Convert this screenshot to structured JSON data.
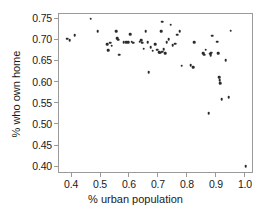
{
  "chart_data": {
    "type": "scatter",
    "title": "",
    "xlabel": "% urban population",
    "ylabel": "% who own home",
    "xlim": [
      0.355,
      1.028
    ],
    "ylim": [
      0.384,
      0.762
    ],
    "xticks": [
      0.4,
      0.5,
      0.6,
      0.7,
      0.8,
      0.9,
      1.0
    ],
    "xtick_labels": [
      "0.4",
      "0.5",
      "0.6",
      "0.7",
      "0.8",
      "0.9",
      "1.0"
    ],
    "yticks": [
      0.4,
      0.45,
      0.5,
      0.55,
      0.6,
      0.65,
      0.7,
      0.75
    ],
    "ytick_labels": [
      "0.40",
      "0.45",
      "0.50",
      "0.55",
      "0.60",
      "0.65",
      "0.70",
      "0.75"
    ],
    "grid": false,
    "legend": "none",
    "marker": "filled-circle",
    "marker_color": "#2b2b2b",
    "frame_color": "#9a9a9a",
    "background": "#ffffff",
    "n_points": 66,
    "points": [
      [
        0.383,
        0.704
      ],
      [
        0.392,
        0.7
      ],
      [
        0.409,
        0.712
      ],
      [
        0.464,
        0.751
      ],
      [
        0.489,
        0.721
      ],
      [
        0.521,
        0.69
      ],
      [
        0.524,
        0.676
      ],
      [
        0.531,
        0.694
      ],
      [
        0.537,
        0.687
      ],
      [
        0.553,
        0.722
      ],
      [
        0.556,
        0.705
      ],
      [
        0.559,
        0.701
      ],
      [
        0.563,
        0.666
      ],
      [
        0.578,
        0.695
      ],
      [
        0.586,
        0.696
      ],
      [
        0.594,
        0.695
      ],
      [
        0.6,
        0.714
      ],
      [
        0.606,
        0.697
      ],
      [
        0.612,
        0.694
      ],
      [
        0.633,
        0.697
      ],
      [
        0.638,
        0.7
      ],
      [
        0.642,
        0.694
      ],
      [
        0.648,
        0.68
      ],
      [
        0.654,
        0.721
      ],
      [
        0.661,
        0.695
      ],
      [
        0.665,
        0.624
      ],
      [
        0.672,
        0.683
      ],
      [
        0.679,
        0.675
      ],
      [
        0.687,
        0.69
      ],
      [
        0.694,
        0.678
      ],
      [
        0.7,
        0.672
      ],
      [
        0.704,
        0.671
      ],
      [
        0.708,
        0.722
      ],
      [
        0.711,
        0.744
      ],
      [
        0.712,
        0.673
      ],
      [
        0.716,
        0.679
      ],
      [
        0.721,
        0.67
      ],
      [
        0.727,
        0.695
      ],
      [
        0.734,
        0.703
      ],
      [
        0.741,
        0.737
      ],
      [
        0.748,
        0.688
      ],
      [
        0.756,
        0.692
      ],
      [
        0.763,
        0.713
      ],
      [
        0.771,
        0.722
      ],
      [
        0.778,
        0.64
      ],
      [
        0.809,
        0.641
      ],
      [
        0.818,
        0.637
      ],
      [
        0.822,
        0.695
      ],
      [
        0.852,
        0.669
      ],
      [
        0.857,
        0.666
      ],
      [
        0.862,
        0.678
      ],
      [
        0.871,
        0.527
      ],
      [
        0.876,
        0.668
      ],
      [
        0.879,
        0.665
      ],
      [
        0.881,
        0.671
      ],
      [
        0.884,
        0.711
      ],
      [
        0.901,
        0.697
      ],
      [
        0.905,
        0.669
      ],
      [
        0.908,
        0.613
      ],
      [
        0.91,
        0.605
      ],
      [
        0.911,
        0.598
      ],
      [
        0.916,
        0.561
      ],
      [
        0.931,
        0.653
      ],
      [
        0.94,
        0.566
      ],
      [
        0.947,
        0.723
      ],
      [
        1.0,
        0.402
      ]
    ]
  }
}
